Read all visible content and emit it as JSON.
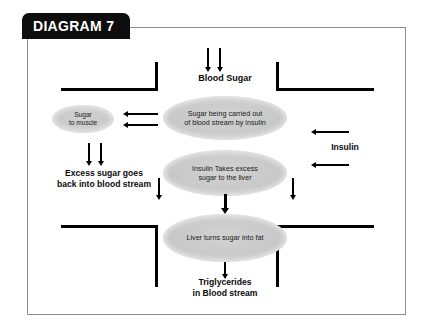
{
  "title_tab": {
    "label": "DIAGRAM 7"
  },
  "labels": {
    "blood_sugar": "Blood Sugar",
    "excess_sugar_line1": "Excess sugar goes",
    "excess_sugar_line2": "back into blood stream",
    "insulin": "Insulin",
    "triglycerides_line1": "Triglycerides",
    "triglycerides_line2": "in Blood stream"
  },
  "nodes": {
    "sugar_to_muscle_line1": "Sugar",
    "sugar_to_muscle_line2": "to muscle",
    "carried_line1": "Sugar being carried out",
    "carried_line2": "of blood stream by insulin",
    "takes_line1": "Insulin Takes excess",
    "takes_line2": "sugar to the liver",
    "liver_fat": "Liver turns sugar into fat"
  },
  "colors": {
    "tab_background": "#0d0d0d",
    "tab_text": "#ffffff",
    "frame_border": "#8d8d8d",
    "ellipse_fill": "#c9c9c9",
    "arrow": "#000000",
    "wall": "#000000",
    "page_background": "#ffffff"
  },
  "icons": {
    "down_arrow": "down-arrow-icon",
    "left_arrow": "left-arrow-icon",
    "vessel_wall": "vessel-wall-icon"
  }
}
